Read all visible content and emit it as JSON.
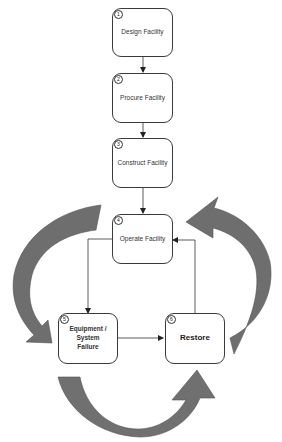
{
  "diagram": {
    "type": "process-flow-cycle",
    "colors": {
      "box_border": "#3a3a3a",
      "connector": "#333333",
      "cycle_arrow_fill": "#6e6e6e",
      "cycle_arrow_light": "#8c8c8c",
      "background": "#ffffff"
    },
    "nodes": [
      {
        "id": "1",
        "number": "1",
        "label": "Design Facility"
      },
      {
        "id": "2",
        "number": "2",
        "label": "Procure Facility"
      },
      {
        "id": "3",
        "number": "3",
        "label": "Construct Facility"
      },
      {
        "id": "4",
        "number": "4",
        "label": "Operate Facility"
      },
      {
        "id": "5",
        "number": "5",
        "label": "Equipment / System Failure"
      },
      {
        "id": "6",
        "number": "6",
        "label": "Restore"
      }
    ],
    "edges": [
      {
        "from": "1",
        "to": "2"
      },
      {
        "from": "2",
        "to": "3"
      },
      {
        "from": "3",
        "to": "4"
      },
      {
        "from": "4",
        "to": "5"
      },
      {
        "from": "5",
        "to": "6"
      },
      {
        "from": "6",
        "to": "4"
      }
    ],
    "cycle_arrows": [
      {
        "name": "left-curved-arrow",
        "direction": "from Operate Facility down to Equipment / System Failure"
      },
      {
        "name": "bottom-curved-arrow",
        "direction": "from Equipment / System Failure to Restore"
      },
      {
        "name": "right-curved-arrow",
        "direction": "from Restore up to Operate Facility"
      }
    ]
  }
}
